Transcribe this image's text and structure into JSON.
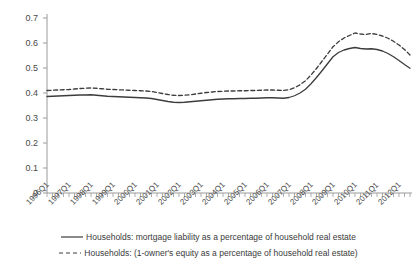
{
  "chart_data": {
    "type": "line",
    "title": "",
    "xlabel": "",
    "ylabel": "",
    "ylim": [
      0,
      0.7
    ],
    "ytick_labels": [
      "0",
      "0.1",
      "0.2",
      "0.3",
      "0.4",
      "0.5",
      "0.6",
      "0.7"
    ],
    "ytick_values": [
      0,
      0.1,
      0.2,
      0.3,
      0.4,
      0.5,
      0.6,
      0.7
    ],
    "grid": false,
    "legend_position": "bottom",
    "x_tick_interval": "quarterly",
    "categories": [
      "1996Q1",
      "1996Q2",
      "1996Q3",
      "1996Q4",
      "1997Q1",
      "1997Q2",
      "1997Q3",
      "1997Q4",
      "1998Q1",
      "1998Q2",
      "1998Q3",
      "1998Q4",
      "1999Q1",
      "1999Q2",
      "1999Q3",
      "1999Q4",
      "2000Q1",
      "2000Q2",
      "2000Q3",
      "2000Q4",
      "2001Q1",
      "2001Q2",
      "2001Q3",
      "2001Q4",
      "2002Q1",
      "2002Q2",
      "2002Q3",
      "2002Q4",
      "2003Q1",
      "2003Q2",
      "2003Q3",
      "2003Q4",
      "2004Q1",
      "2004Q2",
      "2004Q3",
      "2004Q4",
      "2005Q1",
      "2005Q2",
      "2005Q3",
      "2005Q4",
      "2006Q1",
      "2006Q2",
      "2006Q3",
      "2006Q4",
      "2007Q1",
      "2007Q2",
      "2007Q3",
      "2007Q4",
      "2008Q1",
      "2008Q2",
      "2008Q3",
      "2008Q4",
      "2009Q1",
      "2009Q2",
      "2009Q3",
      "2009Q4",
      "2010Q1",
      "2010Q2",
      "2010Q3",
      "2010Q4",
      "2011Q1",
      "2011Q2",
      "2011Q3",
      "2011Q4",
      "2012Q1",
      "2012Q2",
      "2012Q3"
    ],
    "xtick_labels": [
      "1996Q1",
      "1997Q1",
      "1998Q1",
      "1999Q1",
      "2000Q1",
      "2001Q1",
      "2002Q1",
      "2003Q1",
      "2004Q1",
      "2005Q1",
      "2006Q1",
      "2007Q1",
      "2008Q1",
      "2009Q1",
      "2010Q1",
      "2011Q1",
      "2012Q1"
    ],
    "series": [
      {
        "name": "Households: mortgage liability as a percentage of household real estate",
        "style": "solid",
        "color": "#3c3c3c",
        "values": [
          0.386,
          0.387,
          0.388,
          0.389,
          0.39,
          0.391,
          0.392,
          0.392,
          0.393,
          0.391,
          0.389,
          0.387,
          0.386,
          0.385,
          0.384,
          0.383,
          0.382,
          0.381,
          0.38,
          0.378,
          0.374,
          0.37,
          0.366,
          0.363,
          0.362,
          0.363,
          0.365,
          0.367,
          0.369,
          0.371,
          0.373,
          0.375,
          0.376,
          0.377,
          0.377,
          0.378,
          0.378,
          0.379,
          0.379,
          0.38,
          0.381,
          0.381,
          0.38,
          0.379,
          0.382,
          0.389,
          0.4,
          0.415,
          0.437,
          0.462,
          0.489,
          0.517,
          0.545,
          0.562,
          0.572,
          0.578,
          0.582,
          0.578,
          0.576,
          0.577,
          0.574,
          0.568,
          0.558,
          0.545,
          0.53,
          0.514,
          0.499
        ]
      },
      {
        "name": "Households: (1-owner's equity as a percentage of household real estate)",
        "style": "dashed",
        "color": "#3c3c3c",
        "values": [
          0.41,
          0.411,
          0.412,
          0.413,
          0.414,
          0.416,
          0.418,
          0.419,
          0.42,
          0.419,
          0.417,
          0.415,
          0.414,
          0.413,
          0.412,
          0.411,
          0.41,
          0.409,
          0.408,
          0.406,
          0.402,
          0.398,
          0.394,
          0.391,
          0.39,
          0.391,
          0.393,
          0.396,
          0.399,
          0.402,
          0.404,
          0.406,
          0.407,
          0.408,
          0.408,
          0.409,
          0.409,
          0.41,
          0.41,
          0.411,
          0.412,
          0.412,
          0.411,
          0.41,
          0.413,
          0.421,
          0.433,
          0.449,
          0.472,
          0.498,
          0.527,
          0.556,
          0.585,
          0.605,
          0.62,
          0.63,
          0.64,
          0.636,
          0.634,
          0.638,
          0.634,
          0.628,
          0.619,
          0.607,
          0.592,
          0.574,
          0.552
        ]
      }
    ]
  },
  "legend": {
    "entries": [
      {
        "label": "Households: mortgage liability as a percentage of household real estate",
        "style": "solid"
      },
      {
        "label": "Households: (1-owner's equity as a percentage of household real estate)",
        "style": "dashed"
      }
    ]
  },
  "colors": {
    "line": "#3c3c3c",
    "axis": "#9a9a9a",
    "text": "#3a3a3a",
    "background": "#ffffff"
  }
}
